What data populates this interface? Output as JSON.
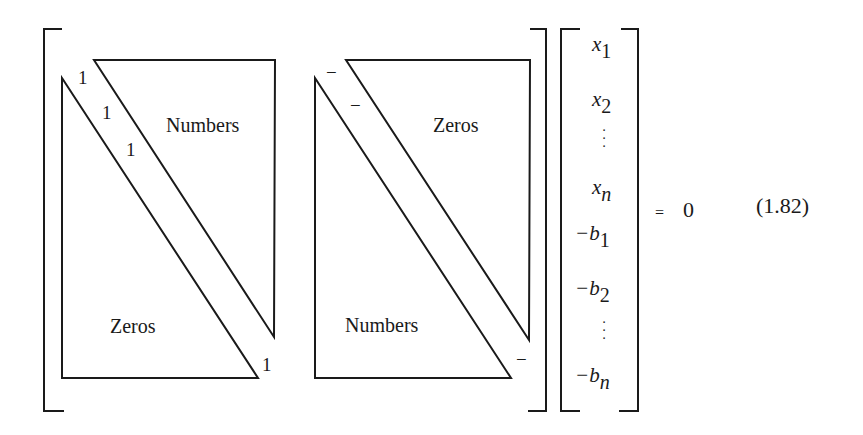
{
  "equation": {
    "matrix_left": {
      "upper_triangle_label": "Numbers",
      "lower_triangle_label": "Zeros",
      "diagonal_entries": [
        "1",
        "1",
        "1",
        "1"
      ]
    },
    "matrix_right": {
      "upper_triangle_label": "Zeros",
      "lower_triangle_label": "Numbers",
      "diagonal_entries": [
        "−",
        "−",
        "−"
      ]
    },
    "vector": {
      "entries": [
        {
          "base": "x",
          "sub": "1"
        },
        {
          "base": "x",
          "sub": "2"
        },
        {
          "base": "",
          "sub": "",
          "ellipsis": "⋮"
        },
        {
          "base": "x",
          "sub": "n"
        },
        {
          "base": "−b",
          "sub": "1"
        },
        {
          "base": "−b",
          "sub": "2"
        },
        {
          "base": "",
          "sub": "",
          "ellipsis": "⋮"
        },
        {
          "base": "−b",
          "sub": "n"
        }
      ]
    },
    "equals": "=",
    "rhs": "0",
    "number": "(1.82)"
  }
}
